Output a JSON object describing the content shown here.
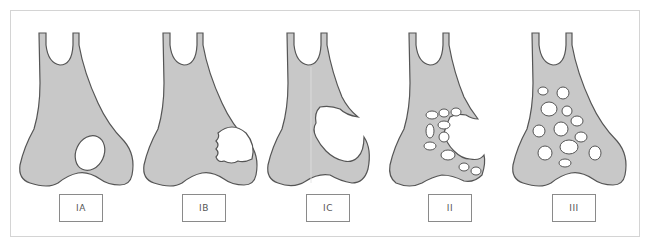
{
  "figure": {
    "colors": {
      "bone_fill": "#c8c8c8",
      "bone_outline": "#555555",
      "hole_fill": "#ffffff",
      "frame": "#d4d4d4"
    },
    "panels": [
      {
        "label": "IA",
        "center_x": 80
      },
      {
        "label": "IB",
        "center_x": 204
      },
      {
        "label": "IC",
        "center_x": 328
      },
      {
        "label": "II",
        "center_x": 450
      },
      {
        "label": "III",
        "center_x": 573
      }
    ]
  }
}
